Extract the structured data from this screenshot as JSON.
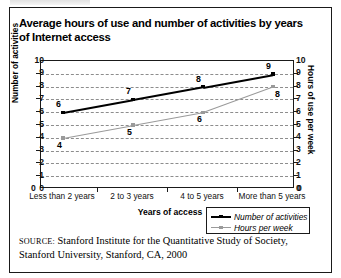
{
  "figure": {
    "title": "Average hours of use and number of activities by years of Internet access",
    "source_label": "SOURCE:",
    "source_text": "Stanford Institute for the Quantitative Study of Society, Stanford University, Stanford, CA, 2000"
  },
  "colors": {
    "activities_series": "#000000",
    "hours_series": "#9a9a9a",
    "axis": "#1a1a1a",
    "gridline": "#8d8d8d",
    "background": "#ffffff"
  },
  "chart_data": {
    "type": "line",
    "title": "Average hours of use and number of activities by years of Internet access",
    "xlabel": "Years of access",
    "ylabel": "Number of activities",
    "ylabel_right": "Hours of use per week",
    "categories": [
      "Less than 2 years",
      "2 to 3 years",
      "4 to 5 years",
      "More than 5 years"
    ],
    "series": [
      {
        "name": "Number of activities",
        "values": [
          6,
          7,
          8,
          9
        ],
        "axis": "left",
        "color": "#000000",
        "marker": "square"
      },
      {
        "name": "Hours per week",
        "values": [
          4,
          5,
          6,
          8
        ],
        "axis": "right",
        "color": "#9a9a9a",
        "marker": "square"
      }
    ],
    "ylim": [
      0,
      10
    ],
    "ylim_right": [
      0,
      10
    ],
    "yticks": [
      0,
      1,
      2,
      3,
      4,
      5,
      6,
      7,
      8,
      9,
      10
    ],
    "yticks_right": [
      0,
      1,
      2,
      3,
      4,
      5,
      6,
      7,
      8,
      9,
      10
    ],
    "grid": true,
    "grid_style": "dashed-horizontal",
    "legend_position": "bottom-right",
    "legend": [
      "Number of activities",
      "Hours per week"
    ]
  }
}
